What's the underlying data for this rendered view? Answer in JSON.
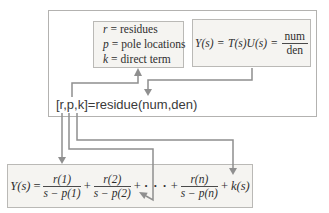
{
  "colors": {
    "line_gray": "#8f8f8f",
    "box_fill": "#f5f4f1",
    "box_border": "#bab9b6",
    "outer_border": "#b3b2b0",
    "text": "#2e2e2e"
  },
  "legend_box": {
    "lines": [
      {
        "var": "r",
        "eq": "=",
        "desc": "residues"
      },
      {
        "var": "p",
        "eq": "=",
        "desc": "pole locations"
      },
      {
        "var": "k",
        "eq": "=",
        "desc": "direct term"
      }
    ]
  },
  "transfer_box": {
    "lhs": "Y(s)",
    "eq1": "=",
    "rhs": "T(s)U(s)",
    "eq2": "=",
    "frac": {
      "num": "num",
      "den": "den"
    }
  },
  "code_line": {
    "text": "[r,p,k]=residue(num,den)"
  },
  "expansion_box": {
    "lhs": "Y(s)",
    "eq": "=",
    "plus": "+",
    "ellipsis": "· · ·",
    "terms": [
      {
        "num": "r(1)",
        "den": "s − p(1)"
      },
      {
        "num": "r(2)",
        "den": "s − p(2)"
      },
      {
        "num": "r(n)",
        "den": "s − p(n)"
      }
    ],
    "direct": "k(s)"
  }
}
